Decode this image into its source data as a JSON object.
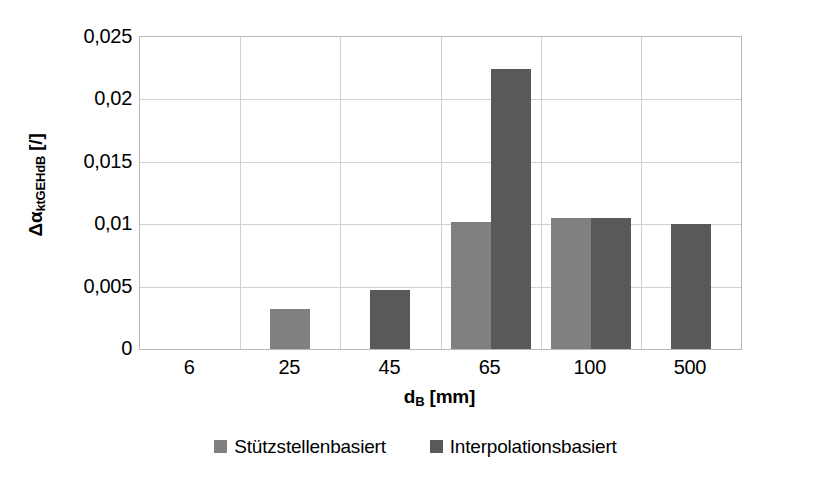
{
  "chart_data": {
    "type": "bar",
    "title": "",
    "subtitle": "",
    "xlabel": "d_B [mm]",
    "xlabel_base": "d",
    "xlabel_sub": "B",
    "xlabel_unit": " [mm]",
    "ylabel": "Δα_ktGEHdB [/]",
    "ylabel_base": "Δα",
    "ylabel_sub": "ktGEHdB",
    "ylabel_unit": " [/]",
    "categories": [
      "6",
      "25",
      "45",
      "65",
      "100",
      "500"
    ],
    "series": [
      {
        "name": "Stützstellenbasiert",
        "color": "#808080",
        "values": [
          0,
          0.0032,
          null,
          0.0102,
          0.0105,
          null
        ]
      },
      {
        "name": "Interpolationsbasiert",
        "color": "#595959",
        "values": [
          0,
          null,
          0.0047,
          0.0224,
          0.0105,
          0.01
        ]
      }
    ],
    "ylim": [
      0,
      0.025
    ],
    "yticks": [
      0,
      0.005,
      0.01,
      0.015,
      0.02,
      0.025
    ],
    "ytick_labels": [
      "0",
      "0,005",
      "0,01",
      "0,015",
      "0,02",
      "0,025"
    ],
    "grid": "horizontal-and-vertical",
    "legend_position": "bottom",
    "decimal_separator": ","
  },
  "legend": {
    "items": [
      {
        "label": "Stützstellenbasiert",
        "color": "#808080"
      },
      {
        "label": "Interpolationsbasiert",
        "color": "#595959"
      }
    ]
  }
}
